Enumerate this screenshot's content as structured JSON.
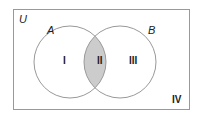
{
  "diagram": {
    "type": "venn",
    "universe_label": "U",
    "sets": [
      {
        "label": "A"
      },
      {
        "label": "B"
      }
    ],
    "regions": [
      {
        "id": "I",
        "label": "I",
        "description": "A only"
      },
      {
        "id": "II",
        "label": "II",
        "description": "A and B",
        "shaded": true
      },
      {
        "id": "III",
        "label": "III",
        "description": "B only"
      },
      {
        "id": "IV",
        "label": "IV",
        "description": "neither A nor B"
      }
    ],
    "colors": {
      "border": "#999999",
      "circle_stroke": "#999999",
      "shade": "#cccccc",
      "text": "#222222"
    }
  }
}
